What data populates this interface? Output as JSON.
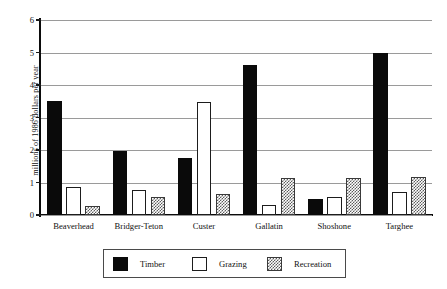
{
  "chart_data": {
    "type": "bar",
    "title": "",
    "subtitle": "",
    "xlabel": "",
    "ylabel": "millions of 1986 dollars per year",
    "ylim": [
      0,
      6
    ],
    "yticks": [
      0,
      1,
      2,
      3,
      4,
      5,
      6
    ],
    "ytick_labels": [
      "0",
      "1",
      "2",
      "3",
      "4",
      "5",
      "6"
    ],
    "grid": true,
    "grid_axis": "y",
    "legend_position": "bottom-center",
    "categories": [
      "Beaverhead",
      "Bridger-Teton",
      "Custer",
      "Gallatin",
      "Shoshone",
      "Targhee"
    ],
    "series": [
      {
        "name": "Timber",
        "color": "#0a0a0a",
        "fill": "solid-black",
        "values": [
          3.52,
          1.96,
          1.75,
          4.61,
          0.48,
          4.98
        ]
      },
      {
        "name": "Grazing",
        "color": "#ffffff",
        "fill": "white-outlined",
        "values": [
          0.87,
          0.78,
          3.49,
          0.3,
          0.56,
          0.72
        ]
      },
      {
        "name": "Recreation",
        "color": "#5d5d5d",
        "fill": "checkerboard-hatch",
        "values": [
          0.27,
          0.55,
          0.65,
          1.15,
          1.15,
          1.17
        ]
      }
    ]
  },
  "legend": {
    "entries": [
      {
        "label": "Timber",
        "swatch": "solid-black-swatch"
      },
      {
        "label": "Grazing",
        "swatch": "white-outline-swatch"
      },
      {
        "label": "Recreation",
        "swatch": "checkered-swatch"
      }
    ]
  },
  "colors": {
    "axis": "#0b0b0b",
    "gridline": "#9a9a9a",
    "timber": "#0a0a0a",
    "grazing": "#ffffff",
    "recreation": "#5d5d5d",
    "background": "#ffffff",
    "legend_border": "#4a4a4a"
  }
}
